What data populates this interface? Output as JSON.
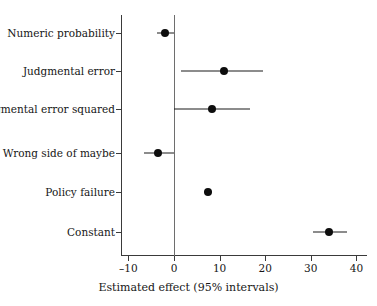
{
  "chart_data": {
    "type": "scatter",
    "subtype": "coefficient-plot",
    "title": "",
    "xlabel": "Estimated effect (95% intervals)",
    "ylabel": "",
    "xlim": [
      -12.5,
      41.5
    ],
    "xticks": [
      -10,
      0,
      10,
      20,
      30,
      40
    ],
    "xticklabels": [
      "–10",
      "0",
      "10",
      "20",
      "30",
      "40"
    ],
    "grid": false,
    "legend": null,
    "reference_line": 0,
    "categories": [
      "Numeric probability",
      "Judgmental error",
      "Judgmental error squared",
      "Wrong side of maybe",
      "Policy failure",
      "Constant"
    ],
    "estimates": [
      -2.0,
      10.9,
      8.3,
      -3.5,
      7.5,
      34.0
    ],
    "ci_low": [
      -3.7,
      1.5,
      0.0,
      -6.6,
      6.6,
      30.5
    ],
    "ci_high": [
      0.0,
      19.5,
      16.7,
      0.0,
      8.4,
      37.9
    ],
    "points": [
      {
        "label": "Numeric probability",
        "estimate": -2.0,
        "ci_low": -3.7,
        "ci_high": 0.0
      },
      {
        "label": "Judgmental error",
        "estimate": 10.9,
        "ci_low": 1.5,
        "ci_high": 19.5
      },
      {
        "label": "Judgmental error squared",
        "estimate": 8.3,
        "ci_low": 0.0,
        "ci_high": 16.7
      },
      {
        "label": "Wrong side of maybe",
        "estimate": -3.5,
        "ci_low": -6.6,
        "ci_high": 0.0
      },
      {
        "label": "Policy failure",
        "estimate": 7.5,
        "ci_low": 6.6,
        "ci_high": 8.4
      },
      {
        "label": "Constant",
        "estimate": 34.0,
        "ci_low": 30.5,
        "ci_high": 37.9
      }
    ],
    "colors": {
      "point": "#0d0d0d",
      "interval": "#1a1a1a",
      "axis": "#3a3a3a",
      "reference_line": "#6e6e6e",
      "background": "#ffffff",
      "text": "#161616"
    }
  }
}
